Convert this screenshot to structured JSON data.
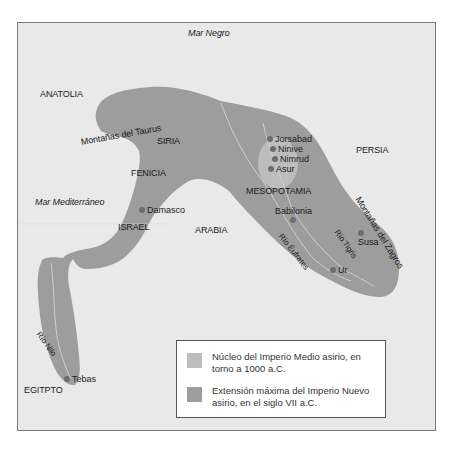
{
  "map": {
    "colors": {
      "background": "#e9e9e9",
      "empire_max": "#9d9d9d",
      "core_medio": "#bdbdbd",
      "city_dot": "#6d6d6d",
      "rivers": "#cfcfcf"
    },
    "seas": [
      {
        "id": "mar-negro",
        "label": "Mar Negro"
      },
      {
        "id": "mar-mediterraneo",
        "label": "Mar Mediterráneo"
      }
    ],
    "regions": {
      "anatolia": "ANATOLIA",
      "siria": "SIRIA",
      "fenicia": "FENICIA",
      "israel": "ISRAEL",
      "arabia": "ARABIA",
      "mesopotamia": "MESOPOTAMIA",
      "persia": "PERSIA",
      "egipto": "EGITPTO"
    },
    "features": {
      "taurus": "Montañas del Taurus",
      "zagros": "Montañas del Zagros",
      "nilo": "Río Nilo",
      "eufrates": "Río Éufrates",
      "tigris": "Río Tigris"
    },
    "cities": {
      "jorsabad": "Jorsabad",
      "ninive": "Ninive",
      "nimrud": "Nimrud",
      "asur": "Asur",
      "babilonia": "Babilonia",
      "damasco": "Damasco",
      "susa": "Susa",
      "ur": "Ur",
      "tebas": "Tebas"
    }
  },
  "legend": {
    "items": [
      {
        "label": "Núcleo del Imperio Medio asirio, en torno a 1000 a.C.",
        "color": "#bdbdbd"
      },
      {
        "label": "Extensión máxima del Imperio Nuevo asirio, en el siglo VII a.C.",
        "color": "#9d9d9d"
      }
    ]
  }
}
